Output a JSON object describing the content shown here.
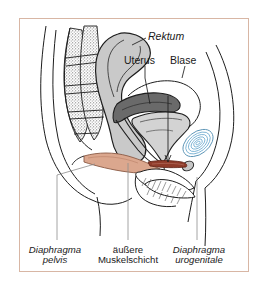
{
  "figure": {
    "frame_color": "#d8b6a4",
    "background_color": "#ffffff"
  },
  "callout_labels": [
    {
      "id": "rektum",
      "text": "Rektum",
      "style": "italic",
      "x": 148,
      "y": 37
    },
    {
      "id": "uterus",
      "text": "Uterus",
      "style": "normal",
      "x": 131,
      "y": 61
    },
    {
      "id": "blase",
      "text": "Blase",
      "style": "normal",
      "x": 172,
      "y": 61
    }
  ],
  "caption_labels": [
    {
      "id": "diaphragma-pelvis",
      "line1": "Diaphragma",
      "line2": "pelvis",
      "style": "italic",
      "x": 53,
      "y": 246
    },
    {
      "id": "aeussere-muskelschicht",
      "line1": "äußere",
      "line2": "Muskelschicht",
      "style": "normal",
      "x": 128,
      "y": 246
    },
    {
      "id": "diaphragma-urogenitale",
      "line1": "Diaphragma",
      "line2": "urogenitale",
      "style": "italic",
      "x": 197,
      "y": 246
    }
  ],
  "anatomy_colors": {
    "outline": "#1e1e1e",
    "rectum_fill": "#c9c9c9",
    "bladder_fill": "#d3d3d3",
    "pelvic_diaphragm_fill": "#dba78e",
    "urogenital_diaphragm_fill": "#8f3b2a",
    "pubic_bone_blue": "#7db4d4",
    "sacrum_stipple": "#6e6e6e",
    "leader_line": "#8d8d8d"
  },
  "anatomy_parts": [
    {
      "id": "rectum",
      "name": "Rektum"
    },
    {
      "id": "uterus",
      "name": "Uterus"
    },
    {
      "id": "bladder",
      "name": "Blase"
    },
    {
      "id": "diaphragma-pelvis",
      "name": "Diaphragma pelvis"
    },
    {
      "id": "aeussere-muskelschicht",
      "name": "äußere Muskelschicht"
    },
    {
      "id": "diaphragma-urogenitale",
      "name": "Diaphragma urogenitale"
    },
    {
      "id": "sacrum",
      "name": "Os sacrum"
    },
    {
      "id": "pubic-symphysis",
      "name": "Symphysis pubica"
    }
  ]
}
